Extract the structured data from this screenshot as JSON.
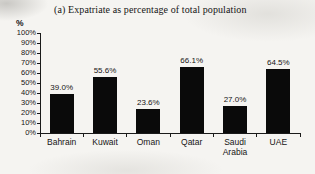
{
  "chart_data": {
    "type": "bar",
    "title": "(a) Expatriate as percentage of total population",
    "ylabel": "%",
    "xlabel": "",
    "categories": [
      "Bahrain",
      "Kuwait",
      "Oman",
      "Qatar",
      "Saudi Arabia",
      "UAE"
    ],
    "values": [
      39.0,
      55.6,
      23.6,
      66.1,
      27.0,
      64.5
    ],
    "data_labels": [
      "39.0%",
      "55.6%",
      "23.6%",
      "66.1%",
      "27.0%",
      "64.5%"
    ],
    "ylim": [
      0,
      100
    ],
    "ytick_step": 10,
    "yticks": [
      "100%",
      "90%",
      "80%",
      "70%",
      "60%",
      "50%",
      "40%",
      "30%",
      "20%",
      "10%",
      "0%"
    ],
    "grid": false,
    "legend": "none",
    "bar_color": "#0a0a0a",
    "background_color": "#f5f4f1"
  }
}
